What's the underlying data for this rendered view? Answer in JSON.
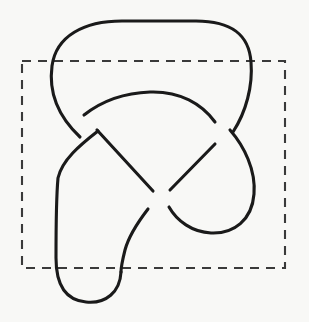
{
  "figure": {
    "background_color": "#f8f8f6",
    "canvas": {
      "width": 309,
      "height": 322
    }
  },
  "knot": {
    "name": "trefoil-knot",
    "type": "knot-diagram",
    "crossing_number": 3,
    "stroke_color": "#1a1a1a",
    "stroke_width": 3.1,
    "crossings": [
      {
        "id": "crossing-upper-left",
        "x": 90,
        "y": 122,
        "over": "descending-right",
        "under": "ascending-right"
      },
      {
        "id": "crossing-center",
        "x": 160,
        "y": 198,
        "over": "ascending-right",
        "under": "descending-right"
      },
      {
        "id": "crossing-right",
        "x": 222,
        "y": 137,
        "over": "descending-right",
        "under": "ascending-right"
      }
    ],
    "segments": [
      {
        "id": "top-outer-loop",
        "description": "Large outer arc across the top from left shoulder to right shoulder",
        "d": "M 80 137 C 62 120 48 96 52 66 C 56 36 84 21 122 21 L 196 21 C 232 21 249 35 251 62 C 253 86 246 112 233 132"
      },
      {
        "id": "inner-arc-over",
        "description": "Inner arc passing over at the upper-left crossing and under at the right crossing",
        "d": "M 84 115 C 98 104 120 93 150 92 C 180 91 202 104 215 122"
      },
      {
        "id": "left-descending-strand",
        "description": "Left strand descending from upper-left crossing down the left side to the bottom U",
        "d": "M 98 131 C 80 145 62 160 58 178 C 56 200 56 230 56 258 C 56 282 64 300 86 302 C 106 304 120 292 121 272"
      },
      {
        "id": "center-s-curve",
        "description": "S-shaped strand from the center crossing down to the bottom U-turn",
        "d": "M 148 209 C 138 222 129 235 125 250 C 122 262 121 268 121 272"
      },
      {
        "id": "diagonal-upper-to-center",
        "description": "Diagonal strand from upper-left crossing down to the center crossing (passes under at center)",
        "d": "M 97 130 L 153 191"
      },
      {
        "id": "diagonal-center-to-right",
        "description": "Diagonal strand from center crossing up to the right crossing (passes under at right)",
        "d": "M 170 190 L 215 144"
      },
      {
        "id": "right-lobe",
        "description": "Right lobe from right crossing sweeping down and back to the center crossing",
        "d": "M 230 130 C 244 146 256 170 254 194 C 252 220 234 234 211 233 C 192 232 177 221 169 207"
      }
    ]
  },
  "region": {
    "name": "dashed-bounding-rectangle",
    "stroke_color": "#3a3a3a",
    "stroke_width": 2.1,
    "dash_pattern": "9 7",
    "x": 22,
    "y": 61,
    "width": 263,
    "height": 207
  }
}
